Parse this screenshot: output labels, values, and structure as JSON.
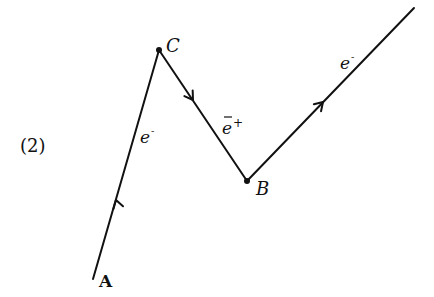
{
  "figure": {
    "equation_number": "(2)",
    "colors": {
      "ink": "#111111",
      "background": "#ffffff"
    },
    "points": {
      "A": {
        "label": "A",
        "x": 93,
        "y": 279
      },
      "C": {
        "label": "C",
        "x": 159,
        "y": 50
      },
      "B": {
        "label": "B",
        "x": 247,
        "y": 181
      },
      "end": {
        "x": 414,
        "y": 8
      }
    },
    "segments": [
      {
        "from": "A",
        "to": "C",
        "particle": "e",
        "superscript": "-",
        "bar": false,
        "label_text": "e-"
      },
      {
        "from": "C",
        "to": "B",
        "particle": "e",
        "superscript": "+",
        "bar": true,
        "label_text": "ē+"
      },
      {
        "from": "B",
        "to": "end",
        "particle": "e",
        "superscript": "-",
        "bar": false,
        "label_text": "e-"
      }
    ]
  }
}
